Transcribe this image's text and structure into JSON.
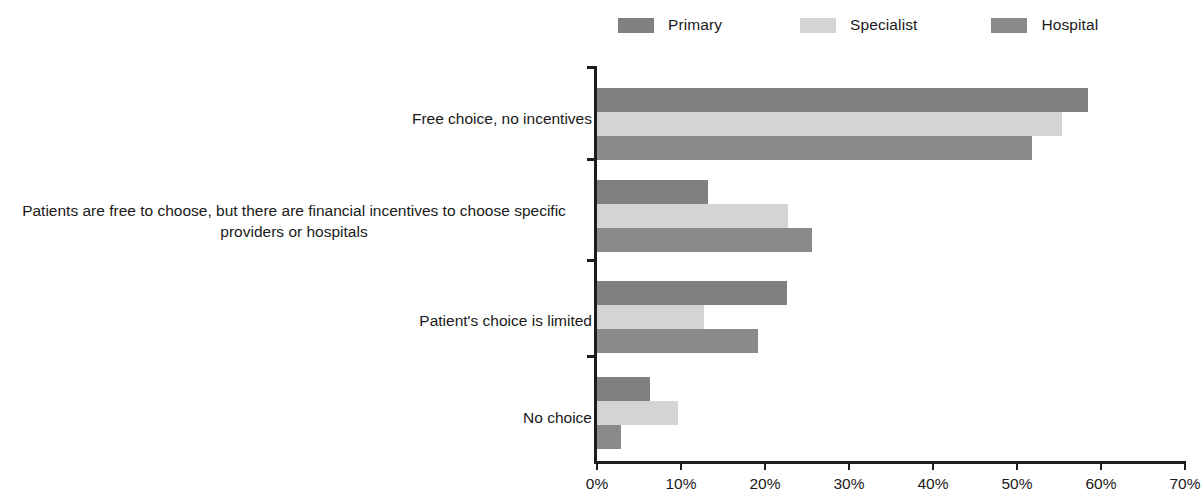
{
  "legend": {
    "items": [
      {
        "label": "Primary",
        "color": "#808080",
        "swatch_name": "legend-swatch-primary"
      },
      {
        "label": "Specialist",
        "color": "#d4d4d4",
        "swatch_name": "legend-swatch-specialist"
      },
      {
        "label": "Hospital",
        "color": "#8a8a8a",
        "swatch_name": "legend-swatch-hospital"
      }
    ]
  },
  "axis": {
    "ticks": [
      "0%",
      "10%",
      "20%",
      "30%",
      "40%",
      "50%",
      "60%",
      "70%"
    ]
  },
  "chart_data": {
    "type": "bar",
    "orientation": "horizontal",
    "title": "",
    "xlabel": "",
    "ylabel": "",
    "xlim": [
      0,
      70
    ],
    "xtick_values": [
      0,
      10,
      20,
      30,
      40,
      50,
      60,
      70
    ],
    "xtick_labels": [
      "0%",
      "10%",
      "20%",
      "30%",
      "40%",
      "50%",
      "60%",
      "70%"
    ],
    "x_unit": "%",
    "grid": false,
    "legend_position": "top",
    "categories": [
      "Free choice, no incentives",
      "Patients are free to choose, but there are financial incentives to choose specific\nproviders or hospitals",
      "Patient's choice is limited",
      "No choice"
    ],
    "series": [
      {
        "name": "Primary",
        "color": "#808080",
        "values": [
          58.4,
          13.2,
          22.6,
          6.3
        ]
      },
      {
        "name": "Specialist",
        "color": "#d4d4d4",
        "values": [
          55.4,
          22.7,
          12.7,
          9.6
        ]
      },
      {
        "name": "Hospital",
        "color": "#8a8a8a",
        "values": [
          51.8,
          25.6,
          19.2,
          2.9
        ]
      }
    ]
  }
}
